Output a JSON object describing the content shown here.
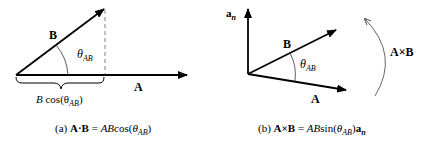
{
  "diagram_a": {
    "vector_a_label": "A",
    "vector_b_label": "B",
    "angle_label": "θ",
    "angle_sub": "AB",
    "projection_label_b": "B",
    "projection_label_rest": " cos(θ",
    "projection_sub": "AB",
    "projection_close": ")",
    "caption_prefix": "(a) ",
    "caption_lhs": "A·B",
    "caption_eq": " = ",
    "caption_rhs": "AB",
    "caption_fn": "cos(",
    "caption_theta": "θ",
    "caption_sub": "AB",
    "caption_close": ")"
  },
  "diagram_b": {
    "normal_label": "a",
    "normal_sub": "n",
    "vector_a_label": "A",
    "vector_b_label": "B",
    "angle_label": "θ",
    "angle_sub": "AB",
    "rotation_label": "A×B",
    "caption_prefix": "(b) ",
    "caption_lhs": "A×B",
    "caption_eq": " = ",
    "caption_rhs": "AB",
    "caption_fn": "sin(",
    "caption_theta": "θ",
    "caption_sub": "AB",
    "caption_close": ")",
    "caption_unit": "a",
    "caption_unit_sub": "n"
  },
  "colors": {
    "stroke": "#000000",
    "dashed": "#666666",
    "arc": "#555555"
  }
}
